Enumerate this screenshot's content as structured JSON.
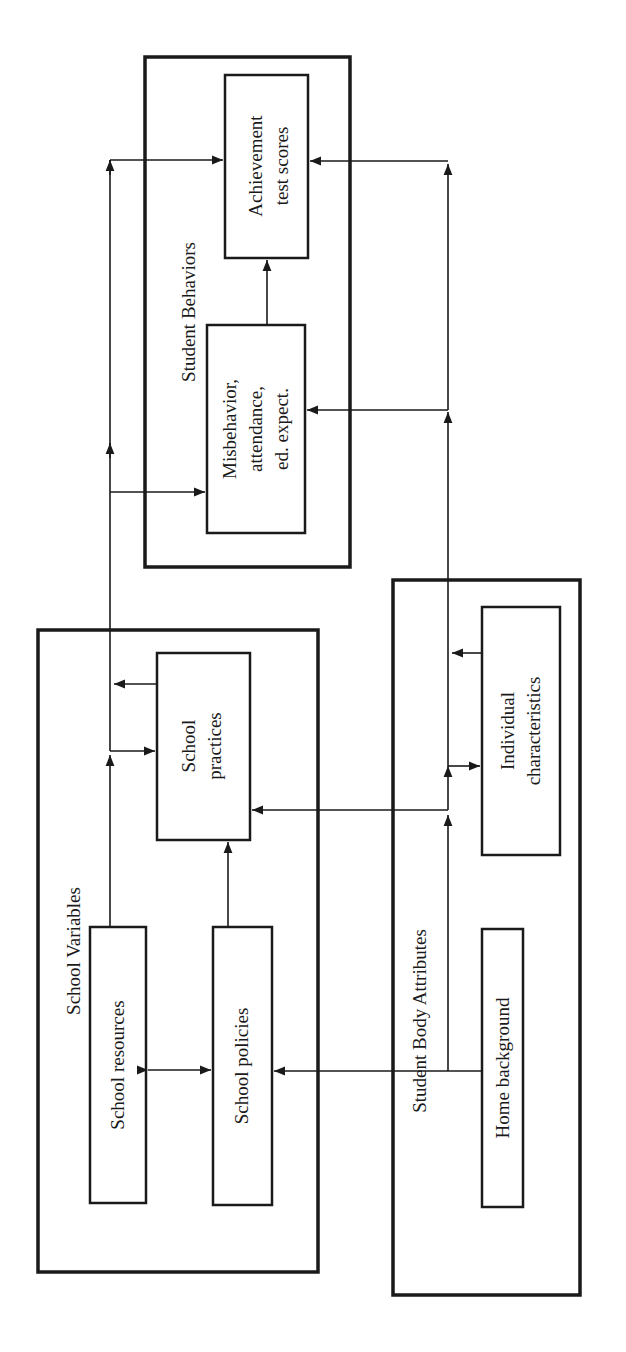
{
  "groups": {
    "student_behaviors": {
      "title": "Student Behaviors"
    },
    "school_variables": {
      "title": "School Variables"
    },
    "student_body_attributes": {
      "title": "Student Body Attributes"
    }
  },
  "nodes": {
    "achievement": {
      "line1": "Achievement",
      "line2": "test scores"
    },
    "misbehavior": {
      "line1": "Misbehavior,",
      "line2": "attendance,",
      "line3": "ed. expect."
    },
    "school_practices": {
      "line1": "School",
      "line2": "practices"
    },
    "school_resources": {
      "label": "School resources"
    },
    "school_policies": {
      "label": "School policies"
    },
    "individual_characteristics": {
      "line1": "Individual",
      "line2": "characteristics"
    },
    "home_background": {
      "label": "Home background"
    }
  },
  "edges": [
    {
      "from": "school_resources",
      "to": "school_policies",
      "type": "bidirectional"
    },
    {
      "from": "school_resources",
      "to": "school_practices"
    },
    {
      "from": "school_policies",
      "to": "school_practices"
    },
    {
      "from": "home_background",
      "to": "school_policies"
    },
    {
      "from": "home_background",
      "to": "school_practices"
    },
    {
      "from": "home_background",
      "to": "individual_characteristics"
    },
    {
      "from": "school_resources",
      "to": "misbehavior"
    },
    {
      "from": "school_resources",
      "to": "achievement"
    },
    {
      "from": "school_practices",
      "to": "misbehavior"
    },
    {
      "from": "school_practices",
      "to": "achievement"
    },
    {
      "from": "home_background",
      "to": "misbehavior"
    },
    {
      "from": "home_background",
      "to": "achievement"
    },
    {
      "from": "individual_characteristics",
      "to": "misbehavior"
    },
    {
      "from": "individual_characteristics",
      "to": "achievement"
    },
    {
      "from": "misbehavior",
      "to": "achievement"
    }
  ],
  "colors": {
    "ink": "#1a1a1a",
    "background": "#ffffff"
  }
}
